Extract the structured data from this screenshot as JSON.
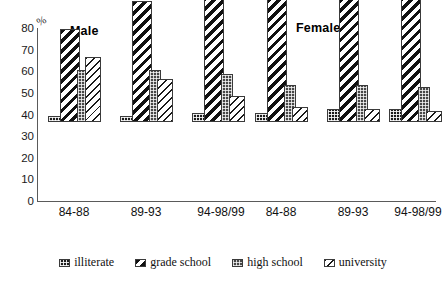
{
  "axis": {
    "unit_label": "%",
    "y_ticks": [
      "80",
      "70",
      "60",
      "50",
      "40",
      "30",
      "20",
      "10",
      "0"
    ]
  },
  "group_titles": {
    "male": "Male",
    "female": "Female"
  },
  "legend": {
    "items": [
      {
        "label": "illiterate",
        "swatch": "swatch-illiterate"
      },
      {
        "label": "grade school",
        "swatch": "swatch-grade-school"
      },
      {
        "label": "high school",
        "swatch": "swatch-high-school"
      },
      {
        "label": "university",
        "swatch": "swatch-university"
      }
    ]
  },
  "x_labels": {
    "male": [
      "84-88",
      "89-93",
      "94-98/99"
    ],
    "female": [
      "84-88",
      "89-93",
      "94-98/99"
    ]
  },
  "chart_data": {
    "type": "bar",
    "title": "",
    "xlabel": "",
    "ylabel": "%",
    "ylim": [
      0,
      80
    ],
    "yticks": [
      0,
      10,
      20,
      30,
      40,
      50,
      60,
      70,
      80
    ],
    "grid": false,
    "legend_position": "bottom",
    "panels": [
      "Male",
      "Female"
    ],
    "categories": [
      "84-88",
      "89-93",
      "94-98/99"
    ],
    "series": [
      {
        "name": "illiterate",
        "Male": [
          3,
          3,
          4
        ],
        "Female": [
          4,
          6,
          6
        ]
      },
      {
        "name": "grade school",
        "Male": [
          43,
          56,
          63
        ],
        "Female": [
          71,
          71,
          72
        ]
      },
      {
        "name": "high school",
        "Male": [
          24,
          24,
          22
        ],
        "Female": [
          17,
          17,
          16
        ]
      },
      {
        "name": "university",
        "Male": [
          30,
          20,
          12
        ],
        "Female": [
          7,
          6,
          5
        ]
      }
    ]
  },
  "top_artifact": "                                                             "
}
